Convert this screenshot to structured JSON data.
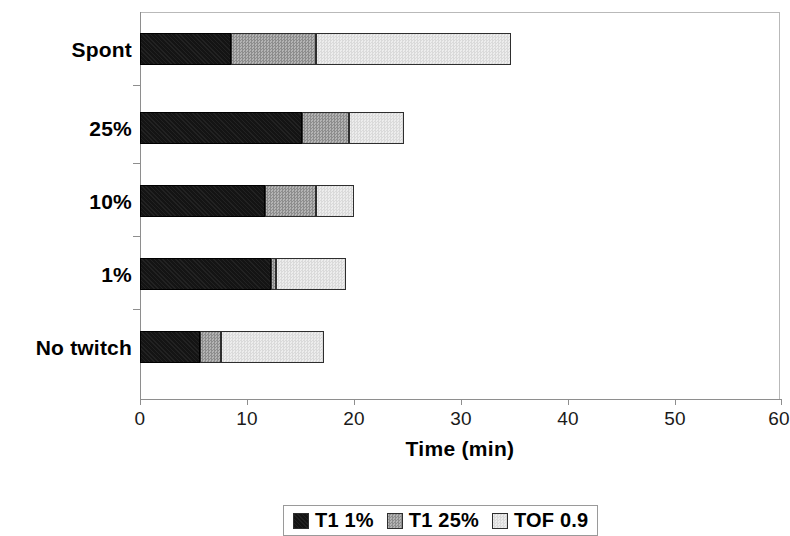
{
  "chart_data": {
    "type": "bar",
    "orientation": "horizontal",
    "stacked": true,
    "title": "",
    "xlabel": "Time (min)",
    "ylabel": "",
    "xlim": [
      0,
      60
    ],
    "xticks": [
      0,
      10,
      20,
      30,
      40,
      50,
      60
    ],
    "xtick_labels": [
      "0",
      "10",
      "20",
      "30",
      "40",
      "50",
      "60"
    ],
    "grid": false,
    "legend_position": "bottom",
    "categories": [
      "Spont",
      "25%",
      "10%",
      "1%",
      "No twitch"
    ],
    "series": [
      {
        "name": "T1 1%",
        "color": "#141414",
        "values": [
          8.5,
          15.2,
          11.7,
          12.3,
          5.6
        ]
      },
      {
        "name": "T1 25%",
        "color": "#a0a0a0",
        "values": [
          8.0,
          4.4,
          4.8,
          0.4,
          2.0
        ]
      },
      {
        "name": "TOF 0.9",
        "color": "#e2e2e2",
        "values": [
          18.2,
          5.1,
          3.5,
          6.6,
          9.6
        ]
      }
    ],
    "cumulative_totals": [
      34.7,
      24.7,
      20.0,
      19.3,
      17.2
    ]
  },
  "axis": {
    "x_title": "Time (min)",
    "tick_labels": [
      "0",
      "10",
      "20",
      "30",
      "40",
      "50",
      "60"
    ],
    "category_labels": [
      "Spont",
      "25%",
      "10%",
      "1%",
      "No twitch"
    ]
  },
  "legend": {
    "items": [
      {
        "label": "T1 1%"
      },
      {
        "label": "T1 25%"
      },
      {
        "label": "TOF 0.9"
      }
    ]
  }
}
